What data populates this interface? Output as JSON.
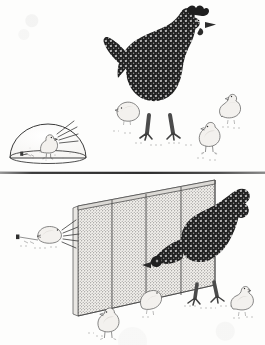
{
  "figure": {
    "medium": "pen-and-ink with halftone stipple, scanned grayscale",
    "background_color": "#fdfdfc",
    "ink_color": "#2b2b2b",
    "panel_divider": {
      "name": "horizontal-rule",
      "y": 172,
      "color": "#2a2a2a"
    },
    "panels": [
      {
        "id": "top",
        "label": "",
        "subjects": [
          {
            "name": "inset-dome-scene",
            "kind": "circular-inset",
            "description": "chick under a transparent dome with radiating lines and a small feeding dish on the ground",
            "contents": [
              "dome",
              "chick",
              "radiating-lines",
              "ground-dish"
            ]
          },
          {
            "name": "hen-standing",
            "kind": "hen",
            "plumage": "dark speckled",
            "pose": "standing upright, head raised, facing right"
          },
          {
            "name": "chick-left",
            "kind": "chick",
            "plumage": "light",
            "pose": "pecking at ground"
          },
          {
            "name": "chick-upper-right",
            "kind": "chick",
            "plumage": "light",
            "pose": "standing, facing left"
          },
          {
            "name": "chick-lower-right",
            "kind": "chick",
            "plumage": "light",
            "pose": "standing upright, facing left"
          }
        ]
      },
      {
        "id": "bottom",
        "label": "",
        "subjects": [
          {
            "name": "wire-screen-panel",
            "kind": "fence-screen",
            "description": "stippled mesh screen panel in perspective with three vertical frame posts and a top rail",
            "post_count": 3
          },
          {
            "name": "hen-reaching",
            "kind": "hen",
            "plumage": "dark speckled",
            "pose": "body behind screen, head and neck lowered and thrust through toward the left"
          },
          {
            "name": "chick-outside-left",
            "kind": "chick",
            "plumage": "light",
            "pose": "pecking at ground on the far side of the screen, radiating lines behind it",
            "has_radiating_lines": true
          },
          {
            "name": "chick-front",
            "kind": "chick",
            "plumage": "light",
            "pose": "standing, facing left"
          },
          {
            "name": "chick-mid",
            "kind": "chick",
            "plumage": "light",
            "pose": "bent forward, pecking"
          },
          {
            "name": "chick-right",
            "kind": "chick",
            "plumage": "light",
            "pose": "standing, facing right"
          }
        ]
      }
    ]
  }
}
